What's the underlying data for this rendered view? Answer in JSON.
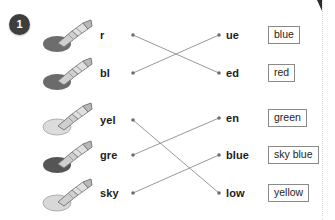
{
  "exercise": {
    "number": "1"
  },
  "rows": [
    {
      "icon": "crayon-icon",
      "blob_color": "#6d6d6d",
      "left_part": "r",
      "right_part": "ue",
      "word_box": "blue",
      "left_y": 35,
      "right_y": 35,
      "box_y": 35
    },
    {
      "icon": "crayon-icon",
      "blob_color": "#6b6b6b",
      "left_part": "bl",
      "right_part": "ed",
      "word_box": "red",
      "left_y": 73,
      "right_y": 73,
      "box_y": 73
    },
    {
      "icon": "crayon-icon",
      "blob_color": "#dcdcdc",
      "left_part": "yel",
      "right_part": "en",
      "word_box": "green",
      "left_y": 120,
      "right_y": 118,
      "box_y": 118
    },
    {
      "icon": "crayon-icon",
      "blob_color": "#555555",
      "left_part": "gre",
      "right_part": "blue",
      "word_box": "sky blue",
      "left_y": 155,
      "right_y": 155,
      "box_y": 155
    },
    {
      "icon": "crayon-icon",
      "blob_color": "#d8d8d8",
      "left_part": "sky",
      "right_part": "low",
      "word_box": "yellow",
      "left_y": 193,
      "right_y": 193,
      "box_y": 193
    }
  ],
  "matches": [
    {
      "from_label": "r",
      "to_label": "ed",
      "x1": 133,
      "y1": 35,
      "x2": 219,
      "y2": 73
    },
    {
      "from_label": "bl",
      "to_label": "ue",
      "x1": 133,
      "y1": 73,
      "x2": 219,
      "y2": 35
    },
    {
      "from_label": "yel",
      "to_label": "low",
      "x1": 133,
      "y1": 120,
      "x2": 219,
      "y2": 193
    },
    {
      "from_label": "gre",
      "to_label": "en",
      "x1": 133,
      "y1": 155,
      "x2": 219,
      "y2": 118
    },
    {
      "from_label": "sky",
      "to_label": "blue",
      "x1": 133,
      "y1": 193,
      "x2": 219,
      "y2": 155
    }
  ],
  "style": {
    "line_color": "#8d8d8d",
    "dot_color": "#6f6f6f",
    "badge_bg": "#3e3e3e",
    "badge_text": "#ffffff",
    "box_border": "#8a8a8a"
  },
  "crayon_icon_positions": [
    18,
    56,
    101,
    139,
    177
  ]
}
